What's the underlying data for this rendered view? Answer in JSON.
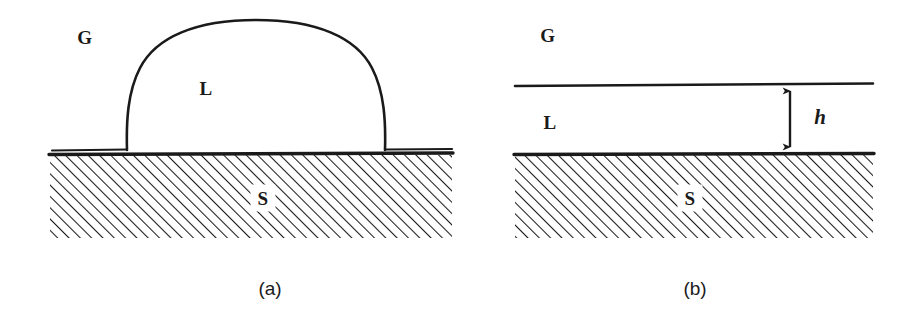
{
  "figure": {
    "width": 918,
    "height": 319,
    "background": "#ffffff",
    "ink_color": "#1a1a1a"
  },
  "phases": {
    "gas": {
      "symbol": "G",
      "name": "gas"
    },
    "liquid": {
      "symbol": "L",
      "name": "liquid"
    },
    "solid": {
      "symbol": "S",
      "name": "solid"
    }
  },
  "panels": [
    {
      "id": "a",
      "caption": "(a)",
      "caption_x": 270,
      "caption_y": 288,
      "title": "partial wetting sessile droplet",
      "labels": [
        {
          "name": "gas-label",
          "text": "G",
          "x": 85,
          "y": 37,
          "on_hatch": false
        },
        {
          "name": "liquid-label",
          "text": "L",
          "x": 206,
          "y": 88,
          "on_hatch": false
        },
        {
          "name": "solid-label",
          "text": "S",
          "x": 263,
          "y": 198,
          "on_hatch": true
        }
      ],
      "geometry": {
        "solid_left": 50,
        "solid_right": 452,
        "solid_top": 155,
        "solid_bottom": 238,
        "baseline_y": 150,
        "drop_left_contact_x": 127,
        "drop_right_contact_x": 385,
        "drop_apex_x": 256,
        "drop_apex_y": 20,
        "drop_base_width": 258,
        "drop_height": 130
      }
    },
    {
      "id": "b",
      "caption": "(b)",
      "caption_x": 236,
      "caption_y": 288,
      "title": "complete wetting uniform liquid film",
      "labels": [
        {
          "name": "gas-label",
          "text": "G",
          "x": 89,
          "y": 35,
          "on_hatch": false
        },
        {
          "name": "liquid-label",
          "text": "L",
          "x": 91,
          "y": 122,
          "on_hatch": false
        },
        {
          "name": "solid-label",
          "text": "S",
          "x": 231,
          "y": 198,
          "on_hatch": true
        }
      ],
      "dimension": {
        "name": "film-thickness",
        "symbol": "h",
        "symbol_x": 361,
        "symbol_y": 117,
        "arrow_x": 331,
        "arrow_top_y": 85,
        "arrow_bottom_y": 153
      },
      "geometry": {
        "solid_left": 56,
        "solid_right": 414,
        "solid_top": 155,
        "solid_bottom": 238,
        "film_surface_y": 85,
        "film_surface_left": 56,
        "film_surface_right": 414
      }
    }
  ],
  "hatching": {
    "angle_degrees": 45,
    "spacing_px": 8,
    "stroke_width": 2.1,
    "direction": "up-to-the-right"
  }
}
